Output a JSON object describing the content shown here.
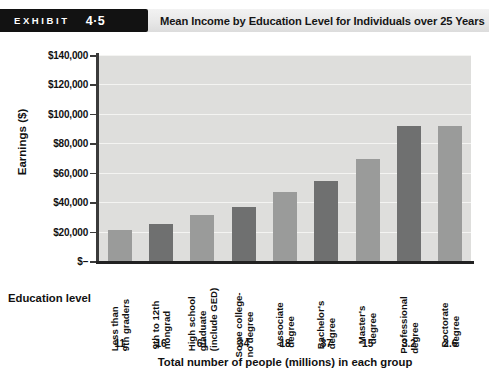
{
  "header": {
    "badge_word": "EXHIBIT",
    "badge_number": "4·5",
    "title": "Mean Income by Education Level for Individuals over 25 Years"
  },
  "axis": {
    "y_title": "Earnings ($)",
    "x_group_label": "Education level",
    "population_caption": "Total number of people (millions) in each group"
  },
  "colors": {
    "bar_light": "#9a9b9a",
    "bar_dark": "#6f7070",
    "plot_background": "#dededc",
    "gridline": "#f4f4f2",
    "axis": "#222222",
    "badge_background": "#121212",
    "header_band": "#e8e8e8"
  },
  "chart_data": {
    "type": "bar",
    "title": "Mean Income by Education Level for Individuals over 25 Years",
    "xlabel": "Education level",
    "ylabel": "Earnings ($)",
    "ylim": [
      0,
      140000
    ],
    "ytick_values": [
      0,
      20000,
      40000,
      60000,
      80000,
      100000,
      120000,
      140000
    ],
    "ytick_labels": [
      "$–",
      "$20,000",
      "$40,000",
      "$60,000",
      "$80,000",
      "$100,000",
      "$120,000",
      "$140,000"
    ],
    "grid": true,
    "legend": "none",
    "categories": [
      "Less than 9th graders",
      "9th to 12th nongrad",
      "High school graduate (include GED)",
      "Some college- no degree",
      "Associate degree",
      "Bachelor's degree",
      "Master's degree",
      "Professional degree",
      "Doctorate degree"
    ],
    "category_lines": [
      [
        "Less than",
        "9th graders"
      ],
      [
        "9th to 12th",
        "nongrad"
      ],
      [
        "High school",
        "graduate",
        "(include GED)"
      ],
      [
        "Some college-",
        "no degree"
      ],
      [
        "Associate",
        "degree"
      ],
      [
        "Bachelor's",
        "degree"
      ],
      [
        "Master's",
        "degree"
      ],
      [
        "Professional",
        "degree"
      ],
      [
        "Doctorate",
        "degree"
      ]
    ],
    "values": [
      21000,
      25000,
      31000,
      36500,
      47000,
      54500,
      69000,
      92000,
      92000
    ],
    "bar_shades": [
      "light",
      "dark",
      "light",
      "dark",
      "light",
      "dark",
      "light",
      "dark",
      "light"
    ],
    "population_millions": [
      "11",
      "16",
      "61",
      "34",
      "18",
      "37",
      "15",
      "3.2",
      "2.6"
    ]
  }
}
